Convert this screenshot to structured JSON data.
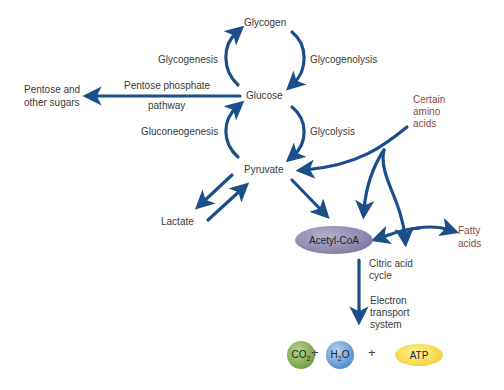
{
  "diagram": {
    "nodes": {
      "glycogen": "Glycogen",
      "glucose": "Glucose",
      "pyruvate": "Pyruvate",
      "lactate": "Lactate",
      "pentose": [
        "Pentose and",
        "other sugars"
      ],
      "amino_acids": [
        "Certain",
        "amino",
        "acids"
      ],
      "acetyl_coa": "Acetyl-CoA",
      "fatty_acids": [
        "Fatty",
        "acids"
      ]
    },
    "processes": {
      "glycogenesis": "Glycogenesis",
      "glycogenolysis": "Glycogenolysis",
      "pentose_pathway": [
        "Pentose phosphate",
        "pathway"
      ],
      "gluconeogenesis": "Gluconeogenesis",
      "glycolysis": "Glycolysis",
      "citric_acid": [
        "Citric acid",
        "cycle"
      ],
      "electron_transport": [
        "Electron",
        "transport",
        "system"
      ]
    },
    "products": {
      "co2": "CO",
      "co2_sub": "2",
      "h2o_h": "H",
      "h2o_sub": "2",
      "h2o_o": "O",
      "atp": "ATP",
      "plus": "+"
    },
    "colors": {
      "arrow": "#1b4f8a",
      "highlight_text": "#8a4a3a",
      "acetyl_coa": "#8f8ab0",
      "co2": "#86ad57",
      "h2o": "#6a9fd8",
      "atp": "#f7dc52"
    }
  }
}
